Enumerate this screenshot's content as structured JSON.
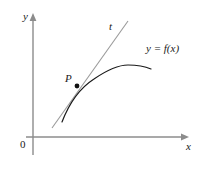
{
  "figure": {
    "background_color": "#ffffff",
    "width": 204,
    "height": 169
  },
  "axes": {
    "color": "#8c8c8c",
    "origin_label": "0",
    "x_axis_label": "x",
    "y_axis_label": "y",
    "x_axis": {
      "start_x": 26,
      "end_x": 188,
      "y": 137
    },
    "y_axis": {
      "x": 33,
      "start_y": 155,
      "end_y": 14
    }
  },
  "curve": {
    "label": "y = f(x)",
    "color": "#1a1a1a",
    "stroke_width": 1.2,
    "path": "M 62,122 C 70,101 80,88 94,79 C 110,68 120,65 128,65 C 136,65 144,66 151,69"
  },
  "tangent": {
    "label": "t",
    "color": "#9a9a9a",
    "stroke_width": 1.1,
    "x1": 52,
    "y1": 128,
    "x2": 128,
    "y2": 21
  },
  "point": {
    "label": "P",
    "color": "#111111",
    "cx": 77,
    "cy": 86,
    "r": 2.4
  },
  "colors": {
    "axis": "#8c8c8c",
    "curve": "#1a1a1a",
    "tangent": "#9a9a9a",
    "text": "#1a1a1a",
    "point": "#111111"
  }
}
